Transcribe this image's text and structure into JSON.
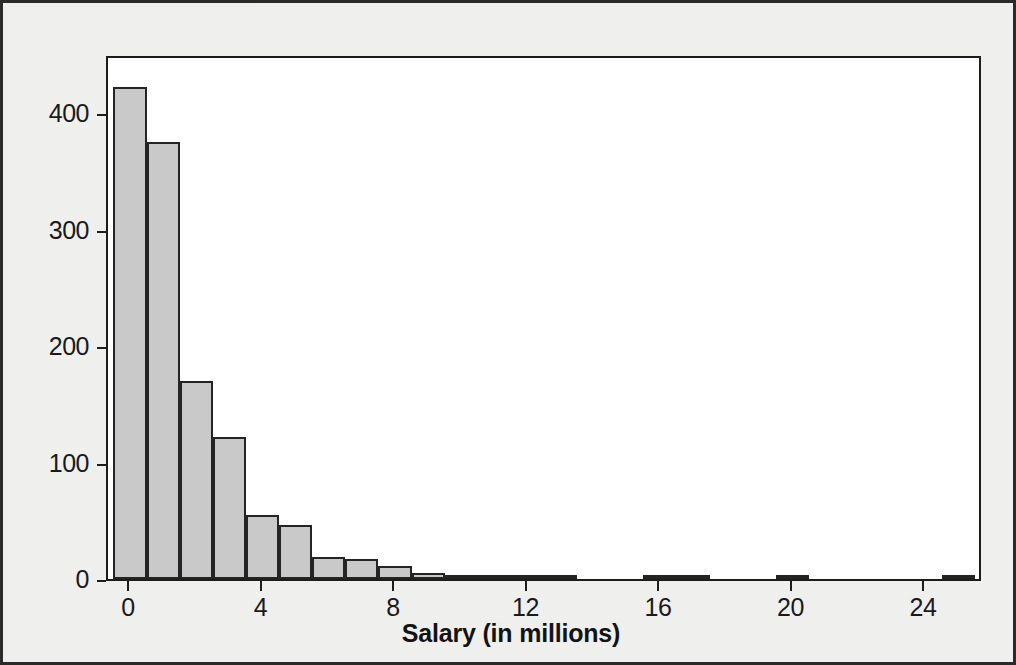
{
  "figure": {
    "background_color": "#f1f1ef",
    "plot_background_color": "#ffffff",
    "border_color": "#2a2a2a",
    "bar_fill_color": "#c9c9c9",
    "bar_edge_color": "#242424"
  },
  "axis": {
    "x_title": "Salary (in millions)",
    "x_tick_labels": [
      "0",
      "4",
      "8",
      "12",
      "16",
      "20",
      "24"
    ],
    "y_tick_labels": [
      "0",
      "100",
      "200",
      "300",
      "400"
    ]
  },
  "chart_data": {
    "type": "bar",
    "title": "",
    "subtitle": "",
    "xlabel": "Salary (in millions)",
    "ylabel": "",
    "grid": false,
    "legend": null,
    "bin_width": 1,
    "xlim": [
      -0.5,
      26.5
    ],
    "ylim": [
      0,
      440
    ],
    "x_ticks": [
      0,
      4,
      8,
      12,
      16,
      20,
      24
    ],
    "y_ticks": [
      0,
      100,
      200,
      300,
      400
    ],
    "categories": [
      "0-1",
      "1-2",
      "2-3",
      "3-4",
      "4-5",
      "5-6",
      "6-7",
      "7-8",
      "8-9",
      "9-10",
      "10-11",
      "11-12",
      "12-13",
      "13-14",
      "16-17",
      "17-18",
      "20-21",
      "25-26"
    ],
    "bin_starts": [
      0,
      1,
      2,
      3,
      4,
      5,
      6,
      7,
      8,
      9,
      10,
      11,
      12,
      13,
      16,
      17,
      20,
      25
    ],
    "values": [
      422,
      375,
      170,
      122,
      55,
      46,
      19,
      17,
      11,
      5,
      2,
      3,
      2,
      1,
      1,
      1,
      1,
      1
    ]
  }
}
